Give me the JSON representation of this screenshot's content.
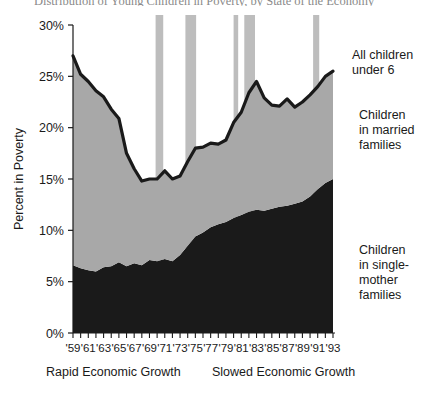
{
  "chart_data": {
    "type": "area",
    "title": "Distribution of Young Children in Poverty, by State of the Economy",
    "xlabel": "",
    "ylabel": "Percent in Poverty",
    "ylim": [
      0,
      30
    ],
    "xlim": [
      1959,
      1993
    ],
    "grid": false,
    "legend_position": "right-inline",
    "ytick_labels": [
      "0%",
      "5%",
      "10%",
      "15%",
      "20%",
      "25%",
      "30%"
    ],
    "ytick_values": [
      0,
      5,
      10,
      15,
      20,
      25,
      30
    ],
    "xtick_labels": [
      "'59",
      "'61",
      "'63",
      "'65",
      "'67",
      "'69",
      "'71",
      "'73",
      "'75",
      "'77",
      "'79",
      "'81",
      "'83",
      "'85",
      "'87",
      "'89",
      "'91",
      "'93"
    ],
    "xtick_values": [
      1959,
      1961,
      1963,
      1965,
      1967,
      1969,
      1971,
      1973,
      1975,
      1977,
      1979,
      1981,
      1983,
      1985,
      1987,
      1989,
      1991,
      1993
    ],
    "x": [
      1959,
      1960,
      1961,
      1962,
      1963,
      1964,
      1965,
      1966,
      1967,
      1968,
      1969,
      1970,
      1971,
      1972,
      1973,
      1974,
      1975,
      1976,
      1977,
      1978,
      1979,
      1980,
      1981,
      1982,
      1983,
      1984,
      1985,
      1986,
      1987,
      1988,
      1989,
      1990,
      1991,
      1992,
      1993
    ],
    "series": [
      {
        "name": "Children in single-mother families",
        "color": "#1a1a1a",
        "values": [
          6.6,
          6.3,
          6.1,
          6.0,
          6.4,
          6.5,
          6.9,
          6.5,
          6.8,
          6.6,
          7.1,
          7.0,
          7.2,
          7.0,
          7.6,
          8.5,
          9.4,
          9.8,
          10.3,
          10.6,
          10.8,
          11.2,
          11.5,
          11.8,
          12.0,
          11.9,
          12.1,
          12.3,
          12.4,
          12.6,
          12.8,
          13.3,
          14.0,
          14.6,
          15.0
        ]
      },
      {
        "name": "Children in married families",
        "color": "#a8a8a8",
        "values": [
          20.4,
          18.9,
          18.4,
          17.6,
          16.6,
          15.3,
          14.0,
          11.0,
          9.2,
          8.2,
          7.9,
          8.0,
          8.6,
          8.0,
          7.7,
          8.2,
          8.6,
          8.3,
          8.2,
          7.8,
          8.0,
          9.3,
          10.0,
          11.6,
          12.5,
          11.0,
          10.1,
          9.8,
          10.4,
          9.4,
          9.7,
          9.9,
          10.0,
          10.4,
          10.5
        ]
      }
    ],
    "total_line": {
      "name": "All children under 6",
      "color": "#1a1a1a",
      "values": [
        27.0,
        25.2,
        24.5,
        23.6,
        23.0,
        21.8,
        20.9,
        17.5,
        16.0,
        14.8,
        15.0,
        15.0,
        15.8,
        15.0,
        15.3,
        16.7,
        18.0,
        18.1,
        18.5,
        18.4,
        18.8,
        20.5,
        21.5,
        23.4,
        24.5,
        22.9,
        22.2,
        22.1,
        22.8,
        22.0,
        22.5,
        23.2,
        24.0,
        25.0,
        25.5
      ]
    },
    "recession_bands": [
      {
        "start": 1969.8,
        "end": 1970.8
      },
      {
        "start": 1973.7,
        "end": 1975.1
      },
      {
        "start": 1980.0,
        "end": 1980.6
      },
      {
        "start": 1981.4,
        "end": 1982.8
      },
      {
        "start": 1990.4,
        "end": 1991.2
      }
    ],
    "recession_color": "#bdbdbd",
    "annotations": [
      {
        "name": "all-children-under-6",
        "text": "All children\nunder 6",
        "lines": [
          "All children",
          "under 6"
        ],
        "x": 352,
        "y": 59
      },
      {
        "name": "children-in-married-families",
        "text": "Children\nin married\nfamilies",
        "lines": [
          "Children",
          "in married",
          "families"
        ],
        "x": 359,
        "y": 119
      },
      {
        "name": "children-in-single-mother-families",
        "text": "Children\nin single-\nmother\nfamilies",
        "lines": [
          "Children",
          "in single-",
          "mother",
          "families"
        ],
        "x": 359,
        "y": 254
      }
    ],
    "era_captions": [
      {
        "name": "rapid-economic-growth",
        "text": "Rapid Economic Growth",
        "x": 46,
        "y": 376
      },
      {
        "name": "slowed-economic-growth",
        "text": "Slowed Economic Growth",
        "x": 212,
        "y": 376
      }
    ]
  }
}
